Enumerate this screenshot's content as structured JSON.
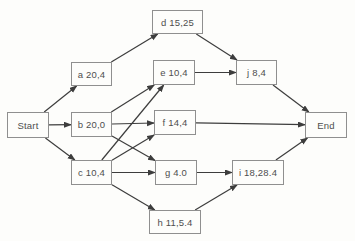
{
  "diagram": {
    "type": "activity-network",
    "colors": {
      "background": "#fdfdfb",
      "box_border": "#8f8f8f",
      "box_fill": "#fdfdfb",
      "text": "#4e4e4e",
      "arrow": "#3d3d3d"
    },
    "nodes": [
      {
        "id": "start",
        "label": "Start",
        "x": 7,
        "y": 112,
        "w": 42,
        "h": 26
      },
      {
        "id": "a",
        "label": "a 20,4",
        "x": 71,
        "y": 62,
        "w": 41,
        "h": 24
      },
      {
        "id": "b",
        "label": "b 20,0",
        "x": 71,
        "y": 112,
        "w": 41,
        "h": 25
      },
      {
        "id": "c",
        "label": "c 10,4",
        "x": 71,
        "y": 160,
        "w": 41,
        "h": 25
      },
      {
        "id": "d",
        "label": "d 15,25",
        "x": 152,
        "y": 10,
        "w": 51,
        "h": 24
      },
      {
        "id": "e",
        "label": "e 10,4",
        "x": 153,
        "y": 60,
        "w": 42,
        "h": 25
      },
      {
        "id": "f",
        "label": "f 14,4",
        "x": 154,
        "y": 110,
        "w": 42,
        "h": 25
      },
      {
        "id": "g",
        "label": "g 4.0",
        "x": 155,
        "y": 160,
        "w": 42,
        "h": 25
      },
      {
        "id": "h",
        "label": "h 11,5.4",
        "x": 149,
        "y": 210,
        "w": 52,
        "h": 24
      },
      {
        "id": "j",
        "label": "j 8,4",
        "x": 236,
        "y": 60,
        "w": 41,
        "h": 25
      },
      {
        "id": "i",
        "label": "i 18,28.4",
        "x": 232,
        "y": 160,
        "w": 52,
        "h": 25
      },
      {
        "id": "end",
        "label": "End",
        "x": 305,
        "y": 112,
        "w": 42,
        "h": 26
      }
    ],
    "edges": [
      {
        "from": "start",
        "to": "a"
      },
      {
        "from": "start",
        "to": "b"
      },
      {
        "from": "start",
        "to": "c"
      },
      {
        "from": "a",
        "to": "d"
      },
      {
        "from": "b",
        "to": "e"
      },
      {
        "from": "b",
        "to": "f"
      },
      {
        "from": "b",
        "to": "g"
      },
      {
        "from": "c",
        "to": "e"
      },
      {
        "from": "c",
        "to": "f"
      },
      {
        "from": "c",
        "to": "g"
      },
      {
        "from": "c",
        "to": "h"
      },
      {
        "from": "d",
        "to": "j"
      },
      {
        "from": "e",
        "to": "j"
      },
      {
        "from": "f",
        "to": "end"
      },
      {
        "from": "g",
        "to": "i"
      },
      {
        "from": "h",
        "to": "i"
      },
      {
        "from": "j",
        "to": "end"
      },
      {
        "from": "i",
        "to": "end"
      }
    ]
  }
}
